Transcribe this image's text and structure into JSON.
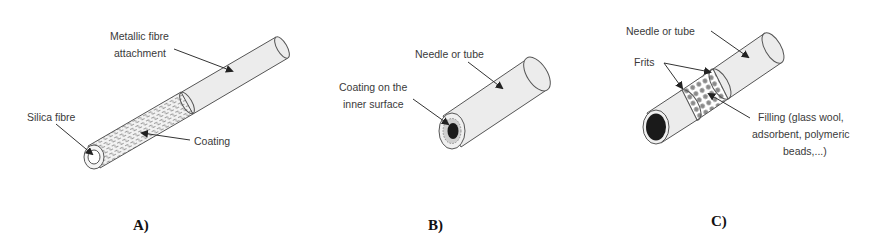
{
  "panels": [
    {
      "id": "A",
      "caption": "A)",
      "labels": {
        "metallic_line1": "Metallic fibre",
        "metallic_line2": "attachment",
        "silica": "Silica fibre",
        "coating": "Coating"
      }
    },
    {
      "id": "B",
      "caption": "B)",
      "labels": {
        "needle": "Needle or tube",
        "coating_line1": "Coating on the",
        "coating_line2": "inner surface"
      }
    },
    {
      "id": "C",
      "caption": "C)",
      "labels": {
        "needle": "Needle or tube",
        "frits": "Frits",
        "filling_line1": "Filling (glass wool,",
        "filling_line2": "adsorbent, polymeric",
        "filling_line3": "beads,...)"
      }
    }
  ],
  "colors": {
    "tube_fill": "#ececec",
    "outline": "#555555",
    "text": "#3a3a3a",
    "dark_core": "#1a1a1a"
  }
}
